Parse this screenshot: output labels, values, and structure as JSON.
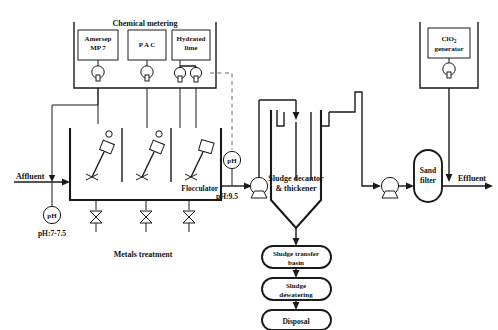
{
  "diagram": {
    "chemical_metering": {
      "section_label": "Chemical metering",
      "chemicals": [
        {
          "name": "chem-amersep",
          "label": "Amersep\nMP 7",
          "line1": "Amersep",
          "line2": "MP 7",
          "pumps": 1
        },
        {
          "name": "chem-pac",
          "label": "P A C",
          "line1": "P A C",
          "line2": "",
          "pumps": 1
        },
        {
          "name": "chem-hydrated-lime",
          "label": "Hydrated lime",
          "line1": "Hydrated",
          "line2": "lime",
          "pumps": 2
        }
      ]
    },
    "clo2": {
      "line1": "ClO",
      "subscript": "2",
      "line2": "generator"
    },
    "streams": {
      "influent_label": "Affluent",
      "effluent_label": "Effluent"
    },
    "instruments": [
      {
        "name": "ph-influent",
        "glyph": "pH",
        "reading": "pH:7-7.5"
      },
      {
        "name": "ph-flocculator-outlet",
        "glyph": "pH",
        "reading": "pH:9.5"
      }
    ],
    "units": {
      "metals_treatment": "Metals treatment",
      "flocculator": "Flocculator",
      "sludge_decantor_line1": "Sludge decantor",
      "sludge_decantor_line2": "& thickener",
      "sand_filter_line1": "Sand",
      "sand_filter_line2": "filter"
    },
    "sludge_train": [
      {
        "name": "sludge-transfer-basin",
        "line1": "Sludge transfer",
        "line2": "basin"
      },
      {
        "name": "sludge-dewatering",
        "line1": "Sludge",
        "line2": "dewatering"
      },
      {
        "name": "disposal",
        "line1": "Disposal",
        "line2": ""
      }
    ],
    "colors": {
      "stroke": "#1a1a1a",
      "signal": "#6b6b6b",
      "background": "#ffffff"
    }
  }
}
